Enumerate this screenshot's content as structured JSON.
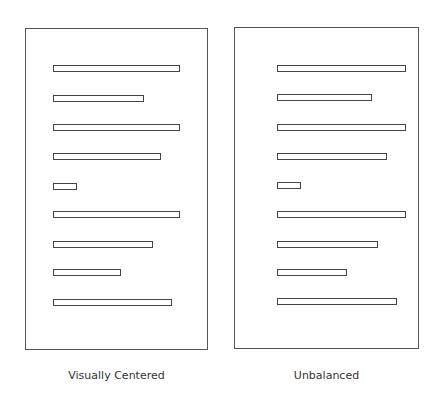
{
  "panels": [
    {
      "id": "visually-centered",
      "caption": "Visually Centered",
      "box": {
        "left": 25,
        "top": 28,
        "width": 183,
        "height": 322
      },
      "caption_pos": {
        "left": 25,
        "top": 369,
        "width": 183
      },
      "bars": [
        {
          "left": 53,
          "top": 65,
          "width": 127
        },
        {
          "left": 53,
          "top": 95,
          "width": 91
        },
        {
          "left": 53,
          "top": 124,
          "width": 127
        },
        {
          "left": 53,
          "top": 153,
          "width": 108
        },
        {
          "left": 53,
          "top": 183,
          "width": 24
        },
        {
          "left": 53,
          "top": 211,
          "width": 127
        },
        {
          "left": 53,
          "top": 241,
          "width": 100
        },
        {
          "left": 53,
          "top": 269,
          "width": 68
        },
        {
          "left": 53,
          "top": 299,
          "width": 119
        }
      ]
    },
    {
      "id": "unbalanced",
      "caption": "Unbalanced",
      "box": {
        "left": 234,
        "top": 27,
        "width": 185,
        "height": 322
      },
      "caption_pos": {
        "left": 234,
        "top": 369,
        "width": 185
      },
      "bars": [
        {
          "left": 277,
          "top": 65,
          "width": 129
        },
        {
          "left": 277,
          "top": 94,
          "width": 95
        },
        {
          "left": 277,
          "top": 124,
          "width": 129
        },
        {
          "left": 277,
          "top": 153,
          "width": 110
        },
        {
          "left": 277,
          "top": 182,
          "width": 24
        },
        {
          "left": 277,
          "top": 211,
          "width": 129
        },
        {
          "left": 277,
          "top": 241,
          "width": 101
        },
        {
          "left": 277,
          "top": 269,
          "width": 70
        },
        {
          "left": 277,
          "top": 298,
          "width": 120
        }
      ]
    }
  ]
}
